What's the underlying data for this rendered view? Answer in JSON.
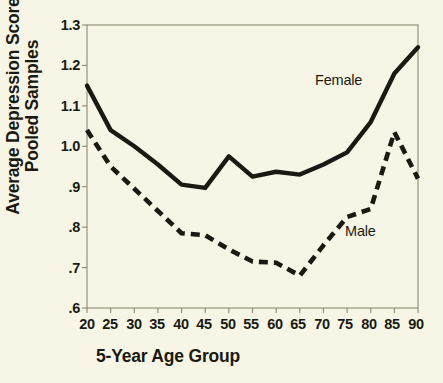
{
  "chart_data": {
    "type": "line",
    "title": "",
    "xlabel": "5-Year Age Group",
    "ylabel_lines": [
      "Average Depression Score",
      "Pooled Samples"
    ],
    "ylabel": "Average Depression Score Pooled Samples",
    "categories": [
      "20",
      "25",
      "30",
      "35",
      "40",
      "45",
      "50",
      "55",
      "60",
      "65",
      "70",
      "75",
      "80",
      "85",
      "90"
    ],
    "x": [
      20,
      25,
      30,
      35,
      40,
      45,
      50,
      55,
      60,
      65,
      70,
      75,
      80,
      85,
      90
    ],
    "xlim": [
      20,
      90
    ],
    "ylim": [
      0.6,
      1.3
    ],
    "ytick_labels": [
      "1.3",
      "1.2",
      "1.1",
      "1.0",
      ".9",
      ".8",
      ".7",
      ".6"
    ],
    "ytick_values": [
      1.3,
      1.2,
      1.1,
      1.0,
      0.9,
      0.8,
      0.7,
      0.6
    ],
    "grid": false,
    "legend_position": "inline-annotations",
    "series": [
      {
        "name": "Female",
        "style": "solid",
        "color": "#1a1a12",
        "values": [
          1.15,
          1.04,
          1.0,
          0.955,
          0.905,
          0.897,
          0.975,
          0.925,
          0.937,
          0.93,
          0.955,
          0.985,
          1.06,
          1.18,
          1.245
        ]
      },
      {
        "name": "Male",
        "style": "dashed",
        "color": "#1a1a12",
        "values": [
          1.04,
          0.95,
          0.895,
          0.84,
          0.785,
          0.78,
          0.745,
          0.715,
          0.712,
          0.68,
          0.755,
          0.825,
          0.845,
          1.035,
          0.92
        ]
      }
    ],
    "annotations": [
      {
        "text": "Female",
        "x": 78,
        "y": 1.21
      },
      {
        "text": "Male",
        "x": 84,
        "y": 0.775
      }
    ],
    "background_color": "#f7f5e6",
    "axis_color": "#8a8a72",
    "text_color": "#1a1a12"
  }
}
